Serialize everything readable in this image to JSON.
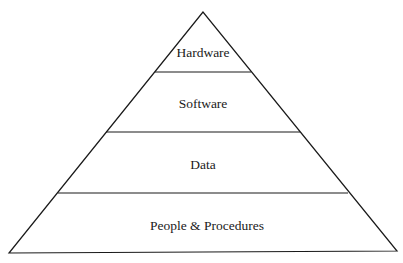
{
  "diagram": {
    "type": "pyramid",
    "colors": {
      "stroke": "#1a1a1a",
      "fill": "#ffffff",
      "text": "#1a1a1a"
    },
    "tiers": [
      {
        "label": "Hardware",
        "position": "top"
      },
      {
        "label": "Software",
        "position": "second"
      },
      {
        "label": "Data",
        "position": "third"
      },
      {
        "label": "People & Procedures",
        "position": "base"
      }
    ]
  }
}
